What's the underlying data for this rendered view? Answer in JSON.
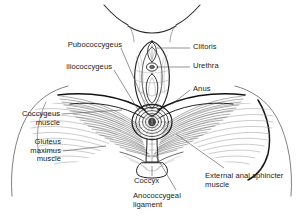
{
  "figure": {
    "view": "Inferior (lithotomy) view of the female perineum",
    "style": "black and white line drawing, pen-and-ink hatching",
    "background_color": "#ffffff",
    "ink_color": "#222222",
    "leader_line_color": "#555555"
  },
  "labels": {
    "pubococcygeus": "Pubococcygeus",
    "iliococcygeus": "iliococcygeus",
    "clitoris": "Clitoris",
    "urethra": "Urethra",
    "anus": "Anus",
    "coccygeus_l1": "Coccygeus",
    "coccygeus_l2": "muscle",
    "gluteus_l1": "Gluteus",
    "gluteus_l2": "maximus",
    "gluteus_l3": "muscle",
    "coccyx": "Coccyx",
    "sphincter_l1": "External anal sphincter",
    "sphincter_l2": "muscle",
    "anococcygeal_l1": "Anococcygeal",
    "anococcygeal_l2": "ligament"
  },
  "structures": [
    {
      "name": "pubococcygeus",
      "label": "Pubococcygeus",
      "side": "left",
      "type": "muscle"
    },
    {
      "name": "iliococcygeus",
      "label": "iliococcygeus",
      "side": "left",
      "type": "muscle"
    },
    {
      "name": "coccygeus-muscle",
      "label": "Coccygeus muscle",
      "side": "left",
      "type": "muscle"
    },
    {
      "name": "gluteus-maximus-muscle",
      "label": "Gluteus maximus muscle",
      "side": "left",
      "type": "muscle"
    },
    {
      "name": "clitoris",
      "label": "Clitoris",
      "side": "right",
      "type": "organ"
    },
    {
      "name": "urethra",
      "label": "Urethra",
      "side": "right",
      "type": "orifice"
    },
    {
      "name": "anus",
      "label": "Anus",
      "side": "right",
      "type": "orifice"
    },
    {
      "name": "external-anal-sphincter",
      "label": "External anal sphincter muscle",
      "side": "right",
      "type": "muscle"
    },
    {
      "name": "coccyx",
      "label": "Coccyx",
      "side": "bottom",
      "type": "bone"
    },
    {
      "name": "anococcygeal-ligament",
      "label": "Anococcygeal ligament",
      "side": "bottom",
      "type": "ligament"
    }
  ]
}
